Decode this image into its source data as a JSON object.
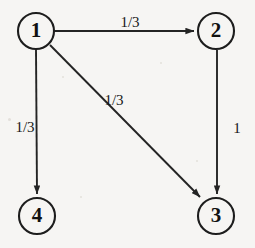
{
  "figure": {
    "type": "directed-graph",
    "background_color": "#f6f5f3",
    "stroke_color": "#242424",
    "node_fill": "#f6f5f3",
    "width": 255,
    "height": 248
  },
  "nodes": [
    {
      "id": "1",
      "label": "1",
      "cx": 36,
      "cy": 31,
      "r": 18
    },
    {
      "id": "2",
      "label": "2",
      "cx": 216,
      "cy": 31,
      "r": 18
    },
    {
      "id": "3",
      "label": "3",
      "cx": 216,
      "cy": 216,
      "r": 18
    },
    {
      "id": "4",
      "label": "4",
      "cx": 37,
      "cy": 216,
      "r": 18
    }
  ],
  "edges": [
    {
      "id": "e12",
      "from": "1",
      "to": "2",
      "label": "1/3",
      "label_x": 130,
      "label_y": 27,
      "x1": 55,
      "y1": 31,
      "x2": 194,
      "y2": 31
    },
    {
      "id": "e14",
      "from": "1",
      "to": "4",
      "label": "1/3",
      "label_x": 25,
      "label_y": 132,
      "x1": 36,
      "y1": 50,
      "x2": 37,
      "y2": 194
    },
    {
      "id": "e13",
      "from": "1",
      "to": "3",
      "label": "1/3",
      "label_x": 114,
      "label_y": 105,
      "x1": 50,
      "y1": 45,
      "x2": 200,
      "y2": 197
    },
    {
      "id": "e23",
      "from": "2",
      "to": "3",
      "label": "1",
      "label_x": 237,
      "label_y": 133,
      "x1": 217,
      "y1": 50,
      "x2": 217,
      "y2": 194
    }
  ]
}
